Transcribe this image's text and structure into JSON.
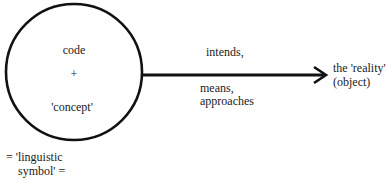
{
  "diagram": {
    "circle": {
      "lines": [
        "code",
        "+",
        "'concept'"
      ]
    },
    "arrow": {
      "label_above": "intends,",
      "label_below_line1": "means,",
      "label_below_line2": "approaches"
    },
    "target": {
      "line1": "the 'reality'",
      "line2": "(object)"
    },
    "caption": {
      "line1": "= 'linguistic",
      "line2": "symbol' ="
    },
    "colors": {
      "stroke": "#111111",
      "text": "#1a1a1a",
      "background": "#ffffff"
    }
  }
}
